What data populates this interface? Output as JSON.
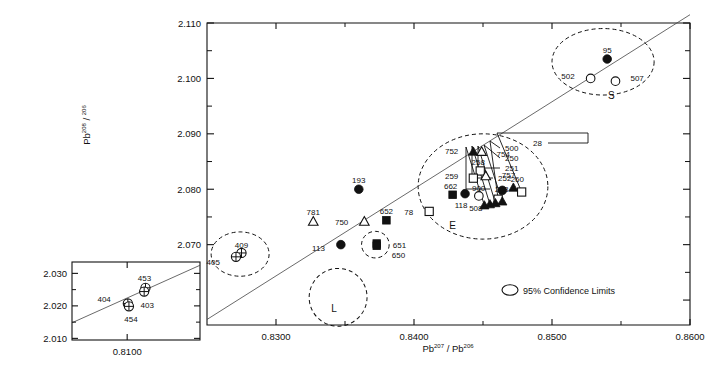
{
  "figure": {
    "x_axis": {
      "title": "Pb 207 / Pb 206",
      "title_base1": "Pb",
      "title_sup1": "207",
      "title_sep": "/",
      "title_base2": "Pb",
      "title_sup2": "206",
      "min": 0.825,
      "max": 0.86,
      "ticks": [
        "0.8300",
        "0.8400",
        "0.8500",
        "0.8600"
      ],
      "tick_values": [
        0.83,
        0.84,
        0.85,
        0.86
      ],
      "minor_values": [
        0.835,
        0.845,
        0.855
      ]
    },
    "y_axis": {
      "title_base": "Pb",
      "title_sup1": "208",
      "title_sep": "/",
      "title_sup2": "206",
      "min": 2.0555,
      "max": 2.11,
      "ticks": [
        "2.060",
        "2.070",
        "2.080",
        "2.090",
        "2.100",
        "2.110"
      ],
      "tick_values": [
        2.06,
        2.07,
        2.08,
        2.09,
        2.1,
        2.11
      ],
      "minor_values": [
        2.065,
        2.075,
        2.085,
        2.095,
        2.105
      ]
    },
    "legend": {
      "symbol": "ellipse-icon",
      "text_a": "95",
      "text_pct": "%",
      "text_b": " Confidence Limits"
    },
    "cluster_labels": [
      {
        "name": "L",
        "x": 0.8342,
        "y": 2.0578
      },
      {
        "name": "E",
        "x": 0.8428,
        "y": 2.0728
      },
      {
        "name": "S",
        "x": 0.8543,
        "y": 2.0963
      }
    ]
  },
  "chart_data": {
    "type": "scatter",
    "title": "",
    "xlabel": "Pb 207 / Pb 206",
    "ylabel": "Pb 208 / 206",
    "xlim": [
      0.825,
      0.86
    ],
    "ylim": [
      2.0555,
      2.11
    ],
    "grid": false,
    "legend": "95% Confidence Limits",
    "regression_line": {
      "x1": 0.825,
      "y1": 2.0565,
      "x2": 0.86,
      "y2": 2.1115
    },
    "points": [
      {
        "label": "409",
        "x": 0.8275,
        "y": 2.0685,
        "marker": "crossed-circle",
        "lab_dx": 0,
        "lab_dy": -8
      },
      {
        "label": "405",
        "x": 0.8271,
        "y": 2.0678,
        "marker": "crossed-circle",
        "lab_dx": -16,
        "lab_dy": 5
      },
      {
        "label": "781",
        "x": 0.8327,
        "y": 2.0742,
        "marker": "open-triangle",
        "lab_dx": 0,
        "lab_dy": -9
      },
      {
        "label": "113",
        "x": 0.8347,
        "y": 2.07,
        "marker": "filled-circle",
        "lab_dx": -16,
        "lab_dy": 3
      },
      {
        "label": "193",
        "x": 0.836,
        "y": 2.08,
        "marker": "filled-circle",
        "lab_dx": 0,
        "lab_dy": -9
      },
      {
        "label": "750",
        "x": 0.8364,
        "y": 2.0742,
        "marker": "open-triangle",
        "lab_dx": -16,
        "lab_dy": 1
      },
      {
        "label": "651",
        "x": 0.8373,
        "y": 2.0702,
        "marker": "filled-square",
        "lab_dx": 16,
        "lab_dy": 1
      },
      {
        "label": "650",
        "x": 0.8373,
        "y": 2.0698,
        "marker": "filled-square",
        "lab_dx": 15,
        "lab_dy": 9
      },
      {
        "label": "652",
        "x": 0.838,
        "y": 2.0744,
        "marker": "filled-square",
        "lab_dx": 0,
        "lab_dy": -9
      },
      {
        "label": "78",
        "x": 0.8411,
        "y": 2.076,
        "marker": "open-square",
        "lab_dx": -16,
        "lab_dy": 1
      },
      {
        "label": "662",
        "x": 0.8428,
        "y": 2.079,
        "marker": "filled-square",
        "lab_dx": -2,
        "lab_dy": -9
      },
      {
        "label": "118",
        "x": 0.8437,
        "y": 2.0792,
        "marker": "filled-circle",
        "lab_dx": -4,
        "lab_dy": 11
      },
      {
        "label": "508",
        "x": 0.8447,
        "y": 2.0788,
        "marker": "open-circle",
        "lab_dx": -3,
        "lab_dy": 12
      },
      {
        "label": "752",
        "x": 0.8443,
        "y": 2.0868,
        "marker": "filled-triangle",
        "lab_dx": -15,
        "lab_dy": -1
      },
      {
        "label": "754",
        "x": 0.8449,
        "y": 2.0868,
        "marker": "open-triangle",
        "lab_dx": 15,
        "lab_dy": 2
      },
      {
        "label": "258",
        "x": 0.8448,
        "y": 2.0833,
        "marker": "open-square",
        "lab_dx": -2,
        "lab_dy": -9
      },
      {
        "label": "259",
        "x": 0.8443,
        "y": 2.082,
        "marker": "open-square",
        "lab_dx": -15,
        "lab_dy": -2
      },
      {
        "label": "757",
        "x": 0.8452,
        "y": 2.0824,
        "marker": "open-triangle",
        "lab_dx": 16,
        "lab_dy": -1
      },
      {
        "label": "900",
        "x": 0.8464,
        "y": 2.0798,
        "marker": "filled-circle",
        "lab_dx": -17,
        "lab_dy": -2
      },
      {
        "label": "260",
        "x": 0.8472,
        "y": 2.0803,
        "marker": "filled-triangle",
        "lab_dx": 4,
        "lab_dy": -9
      },
      {
        "label": "500",
        "x": 0.8461,
        "y": 2.0782,
        "marker": "open-square",
        "callout": true
      },
      {
        "label": "250",
        "x": 0.8464,
        "y": 2.0778,
        "marker": "filled-triangle",
        "callout": true
      },
      {
        "label": "251",
        "x": 0.8459,
        "y": 2.0775,
        "marker": "filled-triangle",
        "callout": true
      },
      {
        "label": "252",
        "x": 0.8455,
        "y": 2.0773,
        "marker": "filled-triangle",
        "callout": true
      },
      {
        "label": "253",
        "x": 0.8451,
        "y": 2.0771,
        "marker": "filled-triangle",
        "callout": true
      },
      {
        "label": "28",
        "x": 0.8478,
        "y": 2.0795,
        "marker": "open-square",
        "callout": true
      },
      {
        "label": "502",
        "x": 0.8528,
        "y": 2.1,
        "marker": "open-circle",
        "lab_dx": -16,
        "lab_dy": -2
      },
      {
        "label": "507",
        "x": 0.8546,
        "y": 2.0995,
        "marker": "open-circle",
        "lab_dx": 15,
        "lab_dy": -3
      },
      {
        "label": "95",
        "x": 0.854,
        "y": 2.1035,
        "marker": "filled-circle",
        "lab_dx": 0,
        "lab_dy": -9
      }
    ],
    "confidence_ellipses": [
      {
        "name": "405-409",
        "cx": 0.8274,
        "cy": 2.0683,
        "rx": 0.0021,
        "ry": 0.004,
        "rot": 0
      },
      {
        "name": "L",
        "cx": 0.8345,
        "cy": 2.0605,
        "rx": 0.0021,
        "ry": 0.0052,
        "rot": -28
      },
      {
        "name": "650-651",
        "cx": 0.8372,
        "cy": 2.07,
        "rx": 0.001,
        "ry": 0.0024,
        "rot": 0
      },
      {
        "name": "E",
        "cx": 0.845,
        "cy": 2.0805,
        "rx": 0.0047,
        "ry": 0.0095,
        "rot": 0
      },
      {
        "name": "S",
        "cx": 0.8537,
        "cy": 2.103,
        "rx": 0.0037,
        "ry": 0.006,
        "rot": 0
      }
    ]
  },
  "inset": {
    "x_ticks": [
      "0.8100"
    ],
    "x_tick_values": [
      0.81
    ],
    "y_ticks": [
      "2.010",
      "2.020",
      "2.030"
    ],
    "y_tick_values": [
      2.01,
      2.02,
      2.03
    ],
    "xlim": [
      0.8075,
      0.8133
    ],
    "ylim": [
      2.0095,
      2.0335
    ],
    "regression_line": {
      "x1": 0.8075,
      "y1": 2.0148,
      "x2": 0.8133,
      "y2": 2.0325
    },
    "points": [
      {
        "label": "404",
        "x": 0.81003,
        "y": 2.02075,
        "marker": "crossed-circle",
        "lab_dx": -17,
        "lab_dy": -4
      },
      {
        "label": "454",
        "x": 0.81008,
        "y": 2.01985,
        "marker": "crossed-circle",
        "lab_dx": 2,
        "lab_dy": 13
      },
      {
        "label": "453",
        "x": 0.81083,
        "y": 2.02555,
        "marker": "crossed-circle",
        "lab_dx": -1,
        "lab_dy": -10
      },
      {
        "label": "403",
        "x": 0.81077,
        "y": 2.0244,
        "marker": "crossed-circle",
        "lab_dx": 3,
        "lab_dy": 13
      }
    ]
  }
}
